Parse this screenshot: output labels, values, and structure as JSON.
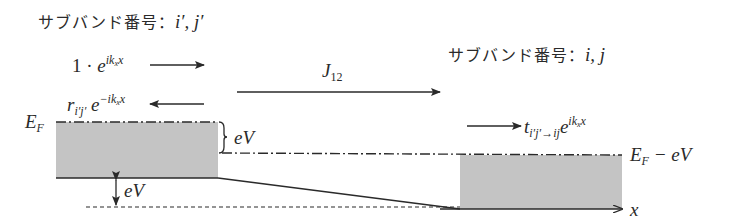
{
  "left_region": {
    "title_text": "サブバンド番号：",
    "title_indices": "i′, j′",
    "incident_wave": {
      "coefficient": "1 · ",
      "base": "e",
      "exponent": "ik",
      "exponent_sub": "x",
      "exponent_tail": "x",
      "direction": "right"
    },
    "reflected_wave": {
      "coefficient": "r",
      "coefficient_sub": "i′j′",
      "base": " e",
      "exponent": "−ik",
      "exponent_sub": "x",
      "exponent_tail": "x",
      "direction": "left"
    },
    "fermi_level_label": "E",
    "fermi_level_sub": "F",
    "bias_brace_label": "eV",
    "bottom_shift_label": "eV"
  },
  "current": {
    "label": "J",
    "label_sub": "12",
    "direction": "right"
  },
  "right_region": {
    "title_text": "サブバンド番号：",
    "title_indices": "i, j",
    "transmitted_wave": {
      "coefficient": "t",
      "coefficient_sub": "i′j′→ij",
      "base": "e",
      "exponent": "ik",
      "exponent_sub": "x",
      "exponent_tail": "x",
      "direction": "right"
    },
    "fermi_level_label": "E",
    "fermi_level_sub": "F",
    "fermi_level_suffix": " − eV"
  },
  "axis": {
    "label": "x"
  },
  "colors": {
    "band_fill": "#c4c4c4",
    "line": "#2a2a2a",
    "text": "#2a2a2a"
  }
}
